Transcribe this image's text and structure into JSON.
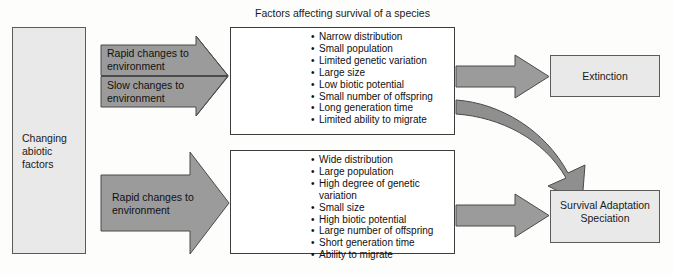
{
  "diagram": {
    "title": "Factors affecting survival of a species",
    "colors": {
      "arrow_fill": "#9b9b9b",
      "arrow_stroke": "#4a4a4a",
      "box_shaded_fill": "#e9e9e9",
      "box_border": "#3d3d3d",
      "text": "#111111",
      "background": "#fdfdfc"
    }
  },
  "source_box": {
    "label": "Changing\nabiotic\nfactors"
  },
  "arrows": [
    {
      "name": "rapid-changes-top",
      "label": "Rapid changes to\nenvironment"
    },
    {
      "name": "slow-changes",
      "label": "Slow changes to\nenvironment"
    },
    {
      "name": "rapid-changes-bottom",
      "label": "Rapid changes to\nenvironment"
    }
  ],
  "species_panels": [
    {
      "name": "low-resilience-species",
      "animal": "condor-bird-illustration",
      "bullets": [
        "Narrow distribution",
        "Small population",
        "Limited genetic variation",
        "Large size",
        "Low biotic potential",
        "Small number of offspring",
        "Long generation time",
        "Limited ability to migrate"
      ]
    },
    {
      "name": "high-resilience-species",
      "animal": "housefly-illustration",
      "bullets": [
        "Wide distribution",
        "Large population",
        "High degree of genetic\n variation",
        "Small size",
        "High biotic potential",
        "Large number of offspring",
        "Short generation time",
        "Ability to migrate"
      ]
    }
  ],
  "outcomes": [
    {
      "name": "extinction",
      "label": "Extinction"
    },
    {
      "name": "survival-adaptation-speciation",
      "label": "Survival\nAdaptation\nSpeciation"
    }
  ]
}
